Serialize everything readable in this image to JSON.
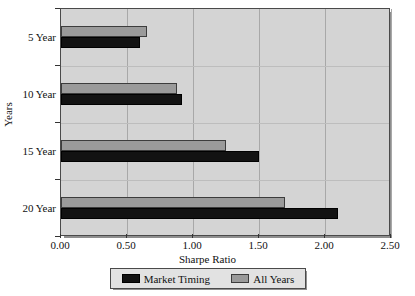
{
  "chart_data": {
    "type": "bar",
    "orientation": "horizontal",
    "title": "",
    "xlabel": "Sharpe Ratio",
    "ylabel": "Years",
    "categories": [
      "5 Year",
      "10 Year",
      "15 Year",
      "20 Year"
    ],
    "series": [
      {
        "name": "Market Timing",
        "color": "#121212",
        "values": [
          0.6,
          0.92,
          1.5,
          2.1
        ]
      },
      {
        "name": "All Years",
        "color": "#9a9a9a",
        "values": [
          0.65,
          0.88,
          1.25,
          1.7
        ]
      }
    ],
    "xlim": [
      0.0,
      2.5
    ],
    "xticks": [
      "0.00",
      "0.50",
      "1.00",
      "1.50",
      "2.00",
      "2.50"
    ],
    "xtick_values": [
      0.0,
      0.5,
      1.0,
      1.5,
      2.0,
      2.5
    ],
    "grid": true,
    "legend_position": "bottom",
    "plot_background": "#d4d4d4",
    "grid_color": "#a8a8a8"
  }
}
